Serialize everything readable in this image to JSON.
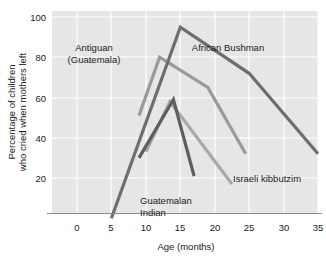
{
  "chart_data": {
    "type": "line",
    "title": "",
    "xlabel": "Age (months)",
    "ylabel": "Percentage of children who cried when mothers left",
    "ylabel_line1": "Percentage of children",
    "ylabel_line2": "who cried when mothers left",
    "xlim": [
      -2.5,
      35
    ],
    "ylim": [
      0,
      100
    ],
    "xticks": [
      0,
      5,
      10,
      15,
      20,
      25,
      30,
      35
    ],
    "xtick_labels": [
      "0",
      "5",
      "10",
      "15",
      "20",
      "25",
      "30",
      "35"
    ],
    "yticks": [
      20,
      40,
      60,
      80,
      100
    ],
    "ytick_labels": [
      "20",
      "40",
      "60",
      "80",
      "100"
    ],
    "grid": true,
    "legend_position": "inline-annotations",
    "plot_background": "#e6e6e6",
    "series": [
      {
        "name": "African Bushman",
        "color": "#6e6e6e",
        "width": 3.2,
        "x": [
          5,
          15,
          25,
          35
        ],
        "values": [
          0,
          95,
          72,
          32
        ],
        "label": "African Bushman",
        "label_x": 228,
        "label_y": 51
      },
      {
        "name": "Antiguan (Guatemala)",
        "color": "#9a9a9a",
        "width": 3.2,
        "x": [
          9,
          12,
          19,
          24.5
        ],
        "values": [
          51,
          80,
          65,
          32
        ],
        "label": "Antiguan",
        "label2": "(Guatemala)",
        "label_x": 94,
        "label_y": 51
      },
      {
        "name": "Guatemalan Indian",
        "color": "#5e5e5e",
        "width": 3.2,
        "x": [
          9,
          14,
          17
        ],
        "values": [
          30,
          59,
          21
        ],
        "label": "Guatemalan",
        "label2": "Indian",
        "label_x": 135,
        "label_y": 202
      },
      {
        "name": "Israeli kibbutzim",
        "color": "#a8a8a8",
        "width": 3.2,
        "x": [
          10,
          13.5,
          22.5
        ],
        "values": [
          33,
          58,
          17
        ],
        "label": "Israeli kibbutzim",
        "label_x": 228,
        "label_y": 181
      }
    ]
  }
}
